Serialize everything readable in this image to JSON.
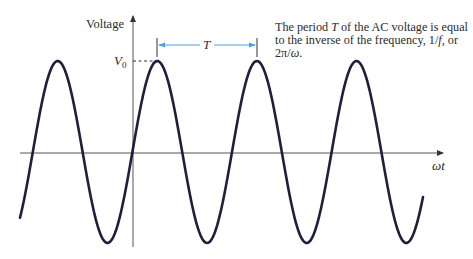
{
  "diagram": {
    "y_axis_label": "Voltage",
    "x_axis_label": "ωt",
    "amplitude_label": "V",
    "amplitude_subscript": "0",
    "period_label": "T",
    "caption": {
      "part1": "The period ",
      "T": "T",
      "part2": " of the AC voltage is equal to the inverse of the frequency, 1/",
      "f": "f",
      "part3": ", or 2π/",
      "omega": "ω",
      "part4": "."
    },
    "colors": {
      "curve": "#1e1f3a",
      "axes": "#555555",
      "period_marker": "#4aa3df",
      "text": "#2b2b2b"
    }
  }
}
